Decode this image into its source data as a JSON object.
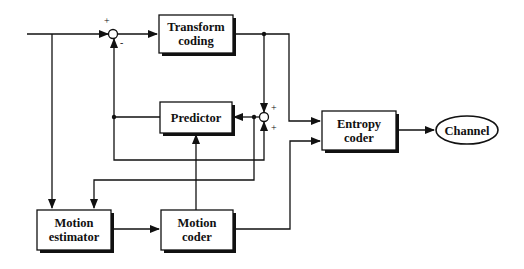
{
  "diagram": {
    "type": "block-diagram",
    "blocks": {
      "transform": {
        "line1": "Transform",
        "line2": "coding"
      },
      "predictor": {
        "line1": "Predictor"
      },
      "entropy": {
        "line1": "Entropy",
        "line2": "coder"
      },
      "channel": {
        "line1": "Channel"
      },
      "motion_estimator": {
        "line1": "Motion",
        "line2": "estimator"
      },
      "motion_coder": {
        "line1": "Motion",
        "line2": "coder"
      }
    },
    "summers": {
      "sum1": {
        "plus": "+",
        "minus": "-"
      },
      "sum2": {
        "plus_top": "+",
        "plus_bottom": "+"
      }
    },
    "edges": [
      {
        "from": "input",
        "to": "sum1",
        "sign": "+"
      },
      {
        "from": "predictor",
        "to": "sum1",
        "sign": "-"
      },
      {
        "from": "sum1",
        "to": "transform"
      },
      {
        "from": "transform",
        "to": "sum2",
        "sign": "+"
      },
      {
        "from": "transform",
        "to": "entropy"
      },
      {
        "from": "predictor",
        "to": "sum2",
        "sign": "+"
      },
      {
        "from": "sum2",
        "to": "predictor"
      },
      {
        "from": "sum2",
        "to": "motion_estimator"
      },
      {
        "from": "input",
        "to": "motion_estimator"
      },
      {
        "from": "motion_estimator",
        "to": "motion_coder"
      },
      {
        "from": "motion_coder",
        "to": "predictor"
      },
      {
        "from": "motion_coder",
        "to": "entropy"
      },
      {
        "from": "entropy",
        "to": "channel"
      }
    ]
  }
}
